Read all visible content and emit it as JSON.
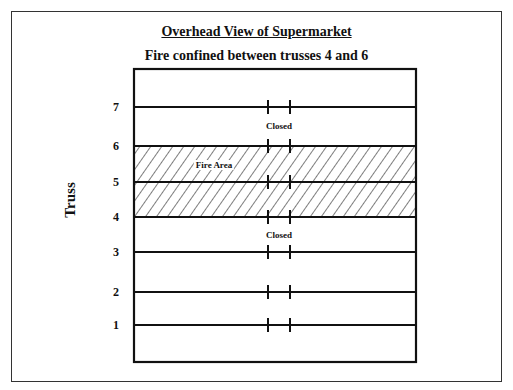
{
  "diagram": {
    "title": "Overhead View of Supermarket",
    "subtitle": "Fire confined between trusses 4 and 6",
    "axis_label": "Truss",
    "trusses": [
      {
        "label": "7",
        "y": 107
      },
      {
        "label": "6",
        "y": 146
      },
      {
        "label": "5",
        "y": 182
      },
      {
        "label": "4",
        "y": 217
      },
      {
        "label": "3",
        "y": 252
      },
      {
        "label": "2",
        "y": 292
      },
      {
        "label": "1",
        "y": 325
      }
    ],
    "annotations": {
      "closed_top": "Closed",
      "fire_area": "Fire Area",
      "closed_bottom": "Closed"
    },
    "fire_zone": {
      "from_truss": "4",
      "to_truss": "6"
    },
    "colors": {
      "line": "#111111",
      "frame": "#333333",
      "background": "#ffffff"
    }
  }
}
